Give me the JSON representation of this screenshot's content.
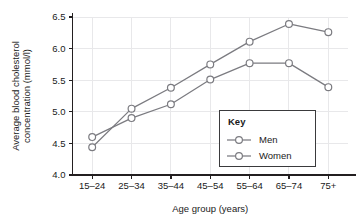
{
  "chart_data": {
    "type": "line",
    "title": "",
    "xlabel": "Age group (years)",
    "ylabel": "Average blood cholesterol concentration (mmol/l)",
    "categories": [
      "15–24",
      "25–34",
      "35–44",
      "45–54",
      "55–64",
      "65–74",
      "75+"
    ],
    "yticks": [
      "4.0",
      "4.5",
      "5.0",
      "5.5",
      "6.0",
      "6.5"
    ],
    "ytick_values": [
      4.0,
      4.5,
      5.0,
      5.5,
      6.0,
      6.5
    ],
    "ylim": [
      4.0,
      6.5
    ],
    "grid": true,
    "legend_position": "inside-bottom-right",
    "series": [
      {
        "name": "Men",
        "values": [
          4.6,
          4.9,
          5.12,
          5.51,
          5.77,
          5.77,
          5.39
        ],
        "marker": "open-circle",
        "color": "#7b7b80"
      },
      {
        "name": "Women",
        "values": [
          4.44,
          5.05,
          5.38,
          5.75,
          6.11,
          6.39,
          6.26
        ],
        "marker": "open-circle",
        "color": "#7b7b80"
      }
    ]
  },
  "legend": {
    "title": "Key",
    "entries": [
      {
        "label": "Men"
      },
      {
        "label": "Women"
      }
    ]
  },
  "colors": {
    "line": "#7b7b80",
    "axis": "#231f20",
    "grid": "#e8e8ea",
    "marker_fill": "#ffffff",
    "legend_border": "#3a3a3c",
    "text": "#1a1a1a",
    "background": "#ffffff"
  }
}
